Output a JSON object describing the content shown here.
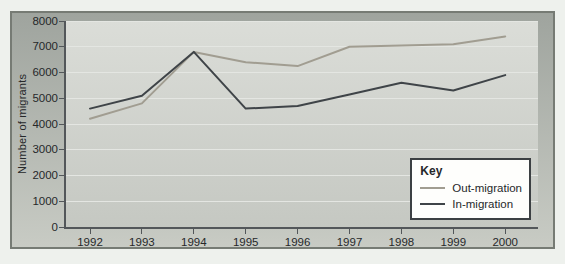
{
  "chart_data": {
    "type": "line",
    "title": "",
    "ylabel": "Number of migrants",
    "x_labels": [
      "1992",
      "1993",
      "1994",
      "1995",
      "1996",
      "1997",
      "1998",
      "1999",
      "2000"
    ],
    "y_ticks": [
      0,
      1000,
      2000,
      3000,
      4000,
      5000,
      6000,
      7000,
      8000
    ],
    "ylim": [
      0,
      8000
    ],
    "grid": true,
    "legend": {
      "title": "Key",
      "position": "inside-bottom-right"
    },
    "series": [
      {
        "name": "Out-migration",
        "color": "#a19d91",
        "values": [
          4200,
          4800,
          6800,
          6400,
          6250,
          7000,
          7050,
          7100,
          7400
        ]
      },
      {
        "name": "In-migration",
        "color": "#3f4448",
        "values": [
          4600,
          5100,
          6800,
          4600,
          4700,
          5150,
          5600,
          5300,
          5900
        ]
      }
    ]
  },
  "colors": {
    "page_bg": "#eef1ed",
    "frame_border": "#767b74",
    "frame_top": "#9fa49e",
    "frame_bottom": "#c8cbc4",
    "plot_top": "#dbddd8",
    "plot_bottom": "#c5c8c2",
    "gridline": "#e4e6e2",
    "axis": "#53575a",
    "text": "#26282a",
    "legend_bg": "#fefefc",
    "legend_border": "#3c4043"
  }
}
